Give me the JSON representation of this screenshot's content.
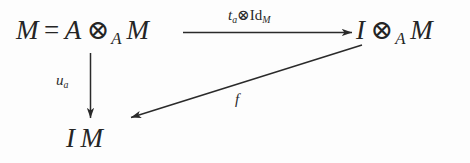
{
  "diagram": {
    "type": "commutative-diagram",
    "background_color": "#fdfdfd",
    "ink_color": "#2a2a2a",
    "nodes": [
      {
        "id": "source",
        "position": "top-left",
        "text": "M = A ⊗_A M",
        "parts": {
          "lhs": "M",
          "equals": "=",
          "first": "A",
          "tensor": "⊗",
          "tensor_sub": "A",
          "second": "M"
        }
      },
      {
        "id": "target",
        "position": "top-right",
        "text": "I ⊗_A M",
        "parts": {
          "first": "I",
          "tensor": "⊗",
          "tensor_sub": "A",
          "second": "M"
        }
      },
      {
        "id": "bottom",
        "position": "bottom-left",
        "text": "I M",
        "parts": {
          "first": "I",
          "second": "M"
        }
      }
    ],
    "arrows": [
      {
        "id": "top-arrow",
        "from": "source",
        "to": "target",
        "direction": "right",
        "label": "t_a ⊗ Id_M",
        "label_parts": {
          "base": "t",
          "base_sub": "a",
          "tensor": "⊗",
          "operator": "Id",
          "operator_sub": "M"
        }
      },
      {
        "id": "left-arrow",
        "from": "source",
        "to": "bottom",
        "direction": "down",
        "label": "u_a",
        "label_parts": {
          "base": "u",
          "base_sub": "a"
        }
      },
      {
        "id": "diagonal-arrow",
        "from": "target",
        "to": "bottom",
        "direction": "down-left",
        "label": "f",
        "label_parts": {
          "base": "f"
        }
      }
    ]
  }
}
